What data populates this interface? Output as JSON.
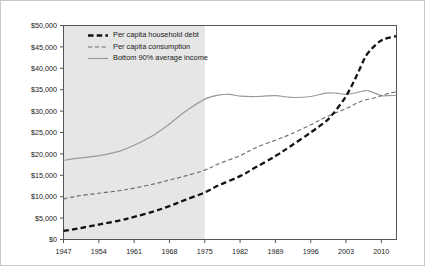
{
  "chart_data": {
    "type": "line",
    "title": "",
    "subtitle": "",
    "xlabel": "",
    "ylabel": "",
    "xlim": [
      1947,
      2013
    ],
    "ylim": [
      0,
      50000
    ],
    "grid": false,
    "legend_position": "top-left",
    "x_tick_labels": [
      "1947",
      "1954",
      "1961",
      "1968",
      "1975",
      "1982",
      "1989",
      "1996",
      "2003",
      "2010"
    ],
    "x_ticks": [
      1947,
      1954,
      1961,
      1968,
      1975,
      1982,
      1989,
      1996,
      2003,
      2010
    ],
    "y_tick_labels": [
      "$0",
      "$5,000",
      "$10,000",
      "$15,000",
      "$20,000",
      "$25,000",
      "$30,000",
      "$35,000",
      "$40,000",
      "$45,000",
      "$50,000"
    ],
    "y_ticks": [
      0,
      5000,
      10000,
      15000,
      20000,
      25000,
      30000,
      35000,
      40000,
      45000,
      50000
    ],
    "shaded_region": {
      "from": 1947,
      "to": 1975,
      "color": "#e6e6e6"
    },
    "series": [
      {
        "name": "Per capita household debt",
        "color": "#111111",
        "style": "dashed-thick",
        "x": [
          1947,
          1950,
          1954,
          1958,
          1961,
          1965,
          1968,
          1971,
          1975,
          1978,
          1982,
          1985,
          1989,
          1992,
          1996,
          1999,
          2000,
          2001,
          2003,
          2005,
          2007,
          2009,
          2010,
          2011,
          2013
        ],
        "values": [
          2000,
          2600,
          3500,
          4400,
          5300,
          6600,
          7800,
          9200,
          11000,
          12800,
          14800,
          16800,
          19500,
          21800,
          25000,
          27600,
          28800,
          30200,
          33500,
          38000,
          43000,
          45600,
          46500,
          47000,
          47500
        ]
      },
      {
        "name": "Per capita consumption",
        "color": "#6e6e6e",
        "style": "dashed-thin",
        "x": [
          1947,
          1950,
          1954,
          1958,
          1961,
          1965,
          1968,
          1971,
          1975,
          1978,
          1982,
          1985,
          1989,
          1992,
          1996,
          1999,
          2003,
          2006,
          2009,
          2011,
          2013
        ],
        "values": [
          9500,
          10200,
          10800,
          11400,
          12000,
          13000,
          13900,
          14800,
          16200,
          17800,
          19600,
          21400,
          23200,
          24600,
          26800,
          28600,
          30600,
          32300,
          33200,
          34000,
          34500
        ]
      },
      {
        "name": "Bottom 90% average income",
        "color": "#9a9a9a",
        "style": "solid",
        "x": [
          1947,
          1950,
          1954,
          1958,
          1961,
          1965,
          1968,
          1971,
          1975,
          1978,
          1980,
          1982,
          1985,
          1989,
          1992,
          1996,
          1999,
          2001,
          2003,
          2005,
          2007,
          2008,
          2010,
          2011,
          2013
        ],
        "values": [
          18500,
          19000,
          19600,
          20600,
          22000,
          24500,
          27000,
          29800,
          32800,
          33800,
          33900,
          33500,
          33400,
          33600,
          33200,
          33400,
          34200,
          34200,
          33900,
          34300,
          34800,
          34500,
          33600,
          33600,
          33700
        ]
      }
    ]
  },
  "legend": {
    "items": [
      {
        "label": "Per capita household debt"
      },
      {
        "label": "Per capita consumption"
      },
      {
        "label": "Bottom 90% average income"
      }
    ]
  }
}
